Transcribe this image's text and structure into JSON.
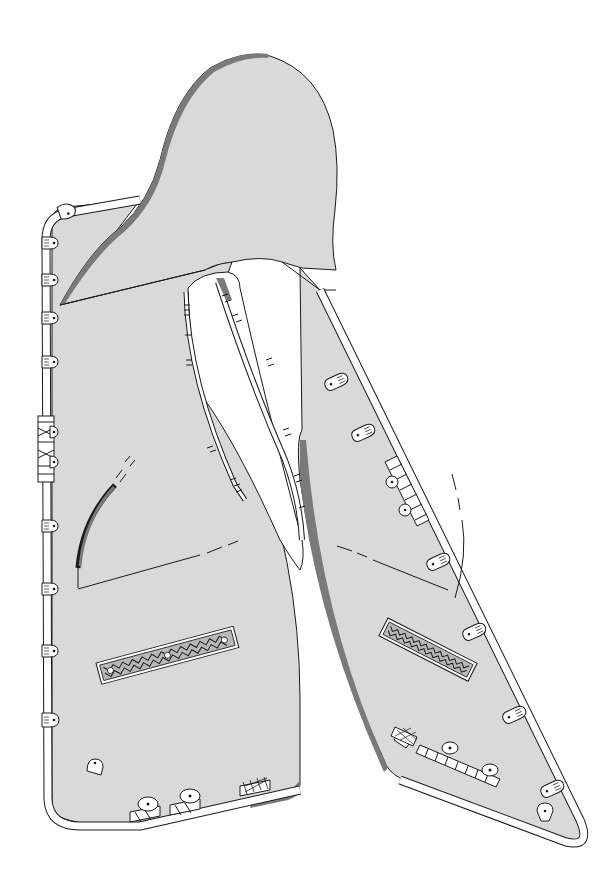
{
  "illustration": {
    "subject": "saddle-with-decorated-frame",
    "width": 616,
    "height": 885,
    "colors": {
      "background": "#ffffff",
      "fill": "#d9d9d9",
      "edge_dark": "#7a7a7a",
      "line": "#1a1a1a",
      "rod": "#ffffff"
    },
    "parts": {
      "seat": "saddle-seat",
      "left_panel": "left-side-panel",
      "right_panel": "right-side-panel",
      "left_plaque": "left-decorative-plaque",
      "right_plaque": "right-decorative-plaque",
      "frame_rod": "frame-rod",
      "clamps": "rod-clamp"
    },
    "left_clamps": [
      {
        "x": 62,
        "y": 215,
        "r": -10
      },
      {
        "x": 46,
        "y": 245,
        "r": 0
      },
      {
        "x": 46,
        "y": 282,
        "r": 0
      },
      {
        "x": 46,
        "y": 320,
        "r": 0
      },
      {
        "x": 46,
        "y": 365,
        "r": 0
      },
      {
        "x": 48,
        "y": 430,
        "r": 0
      },
      {
        "x": 48,
        "y": 462,
        "r": 0
      },
      {
        "x": 48,
        "y": 525,
        "r": 0
      },
      {
        "x": 48,
        "y": 588,
        "r": 0
      },
      {
        "x": 48,
        "y": 650,
        "r": 0
      },
      {
        "x": 52,
        "y": 720,
        "r": 0
      },
      {
        "x": 95,
        "y": 762,
        "r": 0
      }
    ],
    "right_clamps": [
      {
        "x": 340,
        "y": 378,
        "r": -25
      },
      {
        "x": 365,
        "y": 430,
        "r": -25
      },
      {
        "x": 391,
        "y": 480,
        "r": -25
      },
      {
        "x": 403,
        "y": 510,
        "r": -25
      },
      {
        "x": 440,
        "y": 558,
        "r": -25
      },
      {
        "x": 477,
        "y": 630,
        "r": -25
      },
      {
        "x": 517,
        "y": 713,
        "r": -25
      },
      {
        "x": 555,
        "y": 785,
        "r": -25
      },
      {
        "x": 545,
        "y": 815,
        "r": 0
      }
    ]
  }
}
